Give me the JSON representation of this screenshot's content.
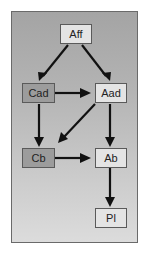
{
  "diagram": {
    "nodes": [
      {
        "id": "Aff",
        "label": "Aff",
        "shade": "light",
        "x": 60,
        "y": 24,
        "w": 32
      },
      {
        "id": "Cad",
        "label": "Cad",
        "shade": "dark",
        "x": 22,
        "y": 83,
        "w": 33
      },
      {
        "id": "Aad",
        "label": "Aad",
        "shade": "light",
        "x": 95,
        "y": 83,
        "w": 32
      },
      {
        "id": "Cb",
        "label": "Cb",
        "shade": "dark",
        "x": 22,
        "y": 148,
        "w": 33
      },
      {
        "id": "Ab",
        "label": "Ab",
        "shade": "light",
        "x": 95,
        "y": 148,
        "w": 32
      },
      {
        "id": "Pl",
        "label": "Pl",
        "shade": "light",
        "x": 95,
        "y": 208,
        "w": 32
      }
    ],
    "edges": [
      {
        "from": "Aff",
        "to": "Cad"
      },
      {
        "from": "Aff",
        "to": "Aad"
      },
      {
        "from": "Cad",
        "to": "Aad"
      },
      {
        "from": "Cad",
        "to": "Cb"
      },
      {
        "from": "Aad",
        "to": "Cb"
      },
      {
        "from": "Aad",
        "to": "Ab"
      },
      {
        "from": "Cb",
        "to": "Ab"
      },
      {
        "from": "Ab",
        "to": "Pl"
      }
    ],
    "colors": {
      "panel_border": "#6a6a6a",
      "light_node": "#e4e4e4",
      "dark_node": "#9c9c9c",
      "arrow": "#111111"
    }
  }
}
